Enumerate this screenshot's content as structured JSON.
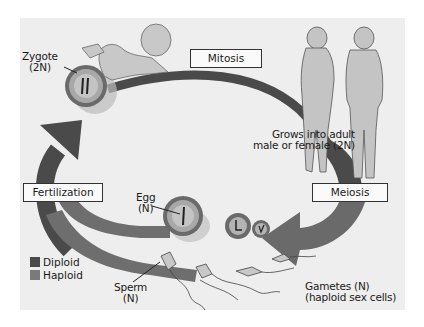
{
  "diagram": {
    "stages": {
      "zygote": {
        "label": "Zygote",
        "ploidy": "(2N)"
      },
      "mitosis": {
        "label": "Mitosis"
      },
      "adult": {
        "line1": "Grows into adult",
        "line2": "male or female (2N)"
      },
      "meiosis": {
        "label": "Meiosis"
      },
      "gametes": {
        "line1": "Gametes (N)",
        "line2": "(haploid sex cells)"
      },
      "egg": {
        "label": "Egg",
        "ploidy": "(N)"
      },
      "sperm": {
        "label": "Sperm",
        "ploidy": "(N)"
      },
      "fertilization": {
        "label": "Fertilization"
      }
    },
    "legend": [
      {
        "label": "Diploid",
        "color": "#4a4a4a"
      },
      {
        "label": "Haploid",
        "color": "#7a7a7a"
      }
    ],
    "colors": {
      "background": "#eeeeee",
      "diploid": "#4a4a4a",
      "haploid": "#7a7a7a",
      "figure_fill": "#c8c8c8",
      "figure_stroke": "#555555"
    }
  }
}
